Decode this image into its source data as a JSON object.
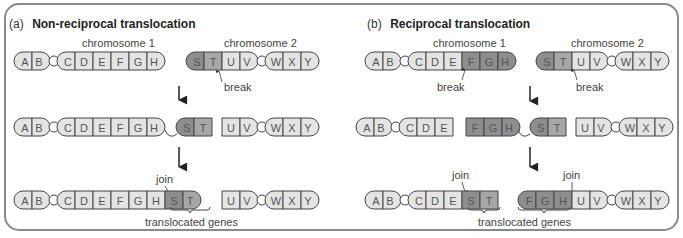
{
  "colors": {
    "light_gene": "#e4e4e4",
    "medium_gene": "#a7a7a7",
    "dark_gene": "#8e8e8e",
    "frame": "#8a8a8a",
    "outline": "#444444"
  },
  "panel_a": {
    "prefix": "(a)",
    "title": "Non-reciprocal translocation",
    "chromosome1_label": "chromosome 1",
    "chromosome2_label": "chromosome 2",
    "break_label": "break",
    "join_label": "join",
    "translocated_label": "translocated genes",
    "rows": [
      {
        "step": "before",
        "chromosome1": [
          "A",
          "B",
          "C",
          "D",
          "E",
          "F",
          "G",
          "H"
        ],
        "chromosome2": [
          "S",
          "T",
          "U",
          "V",
          "W",
          "X",
          "Y"
        ]
      },
      {
        "step": "broken",
        "fragments": [
          [
            "A",
            "B",
            "C",
            "D",
            "E",
            "F",
            "G",
            "H"
          ],
          [
            "S",
            "T"
          ],
          [
            "U",
            "V",
            "W",
            "X",
            "Y"
          ]
        ]
      },
      {
        "step": "after",
        "fragments": [
          [
            "A",
            "B",
            "C",
            "D",
            "E",
            "F",
            "G",
            "H",
            "S",
            "T"
          ],
          [
            "U",
            "V",
            "W",
            "X",
            "Y"
          ]
        ]
      }
    ]
  },
  "panel_b": {
    "prefix": "(b)",
    "title": "Reciprocal translocation",
    "chromosome1_label": "chromosome 1",
    "chromosome2_label": "chromosome 2",
    "break_label_1": "break",
    "break_label_2": "break",
    "join_label_1": "join",
    "join_label_2": "join",
    "translocated_label": "translocated genes",
    "rows": [
      {
        "step": "before",
        "chromosome1": [
          "A",
          "B",
          "C",
          "D",
          "E",
          "F",
          "G",
          "H"
        ],
        "chromosome2": [
          "S",
          "T",
          "U",
          "V",
          "W",
          "X",
          "Y"
        ]
      },
      {
        "step": "broken",
        "fragments": [
          [
            "A",
            "B",
            "C",
            "D",
            "E"
          ],
          [
            "F",
            "G",
            "H"
          ],
          [
            "S",
            "T"
          ],
          [
            "U",
            "V",
            "W",
            "X",
            "Y"
          ]
        ]
      },
      {
        "step": "after",
        "fragments": [
          [
            "A",
            "B",
            "C",
            "D",
            "E",
            "S",
            "T"
          ],
          [
            "F",
            "G",
            "H",
            "U",
            "V",
            "W",
            "X",
            "Y"
          ]
        ]
      }
    ]
  },
  "genes": {
    "A": "A",
    "B": "B",
    "C": "C",
    "D": "D",
    "E": "E",
    "F": "F",
    "G": "G",
    "H": "H",
    "S": "S",
    "T": "T",
    "U": "U",
    "V": "V",
    "W": "W",
    "X": "X",
    "Y": "Y"
  }
}
